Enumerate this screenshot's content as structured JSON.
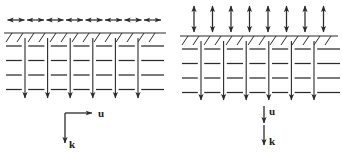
{
  "figure": {
    "title": "",
    "background_color": "#ffffff",
    "ink_color": "#2b2b2b",
    "width": 342,
    "height": 152
  },
  "panels": [
    {
      "id": "left-panel",
      "name": "transverse-wave-panel",
      "motion_arrows": {
        "name": "particle-motion-arrows",
        "orientation": "horizontal",
        "style": "double-headed",
        "count": 8,
        "row_y": 20,
        "start_x": 16,
        "spacing": 19.5,
        "half_length": 8.5
      },
      "surface": {
        "name": "free-surface-line",
        "y": 33,
        "x_start": 4,
        "x_end": 166,
        "hatch": {
          "count": 14,
          "start_x": 12,
          "spacing": 11,
          "dx": -6,
          "dy": 9
        }
      },
      "lattice": {
        "name": "wavefront-lattice",
        "columns": 6,
        "column_start_x": 25,
        "column_spacing": 22.6,
        "column_top_y": 38,
        "column_bottom_y": 98,
        "rows": 4,
        "row_start_y": 46,
        "row_spacing": 14.5,
        "dash_x_start": 6,
        "dash_x_end": 164
      },
      "axes": {
        "name": "vector-indicator-corner",
        "origin_x": 65,
        "origin_y": 113,
        "u": {
          "label": "u",
          "direction": "right",
          "length": 27,
          "label_x": 101,
          "label_y": 117
        },
        "k": {
          "label": "k",
          "direction": "down",
          "length": 30,
          "label_x": 72,
          "label_y": 148
        }
      }
    },
    {
      "id": "right-panel",
      "name": "longitudinal-wave-panel",
      "motion_arrows": {
        "name": "particle-motion-arrows",
        "orientation": "vertical",
        "style": "double-headed",
        "count": 8,
        "row_center_y": 19,
        "start_x": 194,
        "spacing": 18.5,
        "half_length": 13
      },
      "surface": {
        "name": "free-surface-line",
        "y": 36,
        "x_start": 180,
        "x_end": 338,
        "hatch": {
          "count": 14,
          "start_x": 188,
          "spacing": 11,
          "dx": -6,
          "dy": 9
        }
      },
      "lattice": {
        "name": "wavefront-lattice",
        "columns": 6,
        "column_start_x": 201,
        "column_spacing": 22.6,
        "column_top_y": 41,
        "column_bottom_y": 100,
        "rows": 4,
        "row_start_y": 49,
        "row_spacing": 14.5,
        "dash_x_start": 182,
        "dash_x_end": 340
      },
      "axes": {
        "name": "vector-indicator-stack",
        "origin_x": 264,
        "u": {
          "label": "u",
          "direction": "down",
          "y_start": 106,
          "y_end": 123,
          "label_x": 272,
          "label_y": 115
        },
        "k": {
          "label": "k",
          "direction": "down",
          "y_start": 125,
          "y_end": 145,
          "label_x": 272,
          "label_y": 145
        }
      }
    }
  ]
}
